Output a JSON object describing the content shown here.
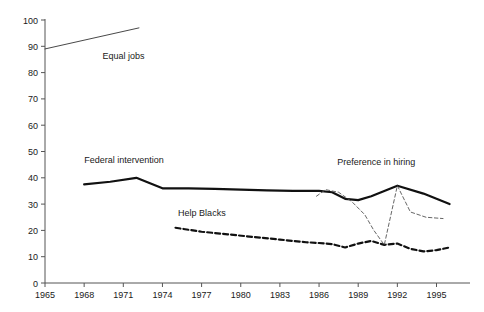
{
  "chart_data": {
    "type": "line",
    "title": "",
    "subtitle": "",
    "xlabel": "",
    "ylabel": "",
    "xlim": [
      1965,
      1996.5
    ],
    "ylim": [
      0,
      100
    ],
    "grid": false,
    "legend_position": "inline-labels",
    "y_ticks": [
      0,
      10,
      20,
      30,
      40,
      50,
      60,
      70,
      80,
      90,
      100
    ],
    "y_tick_labels": [
      "0",
      "10",
      "20",
      "30",
      "40",
      "50",
      "60",
      "70",
      "80",
      "90",
      "100"
    ],
    "x_ticks": [
      1965,
      1968,
      1971,
      1974,
      1977,
      1980,
      1983,
      1986,
      1989,
      1992,
      1995
    ],
    "x_tick_labels": [
      "1965",
      "1968",
      "1971",
      "1974",
      "1977",
      "1980",
      "1983",
      "1986",
      "1989",
      "1992",
      "1995"
    ],
    "series": [
      {
        "name": "Equal jobs",
        "label": "Equal jobs",
        "style": "thin-solid",
        "color": "#333333",
        "label_x": 1969.4,
        "label_y": 85,
        "x": [
          1965,
          1972.2
        ],
        "values": [
          89,
          97
        ]
      },
      {
        "name": "Federal intervention",
        "label": "Federal intervention",
        "style": "thick-solid",
        "color": "#111111",
        "label_x": 1968.0,
        "label_y": 45.5,
        "x": [
          1968,
          1970,
          1972,
          1973,
          1974,
          1976,
          1978,
          1980,
          1982,
          1984,
          1986,
          1987,
          1988,
          1989,
          1990,
          1992,
          1994,
          1996
        ],
        "values": [
          37.5,
          38.5,
          40.0,
          38.0,
          36.0,
          36.0,
          35.8,
          35.5,
          35.2,
          35.0,
          35.0,
          34.5,
          32.0,
          31.5,
          33.0,
          37.0,
          34.0,
          30.0
        ]
      },
      {
        "name": "Help Blacks",
        "label": "Help Blacks",
        "style": "thick-dashed",
        "color": "#111111",
        "label_x": 1975.2,
        "label_y": 25.5,
        "x": [
          1975,
          1977,
          1979,
          1981,
          1983,
          1985,
          1986,
          1987,
          1988,
          1989,
          1990,
          1991,
          1992,
          1993,
          1994,
          1995,
          1996
        ],
        "values": [
          21.0,
          19.5,
          18.5,
          17.5,
          16.5,
          15.5,
          15.2,
          14.8,
          13.5,
          15.0,
          16.0,
          14.5,
          15.0,
          13.0,
          12.0,
          12.5,
          13.5
        ]
      },
      {
        "name": "Preference in hiring",
        "label": "Preference in hiring",
        "style": "thin-dashed",
        "color": "#555555",
        "label_x": 1987.4,
        "label_y": 45.0,
        "x": [
          1985.8,
          1986.5,
          1987.5,
          1988.5,
          1989.5,
          1990.2,
          1991.0,
          1992.0,
          1993.0,
          1994.2,
          1995.5
        ],
        "values": [
          33.0,
          35.5,
          34.5,
          31.0,
          26.0,
          20.0,
          14.5,
          37.0,
          27.0,
          25.0,
          24.5
        ]
      }
    ]
  }
}
